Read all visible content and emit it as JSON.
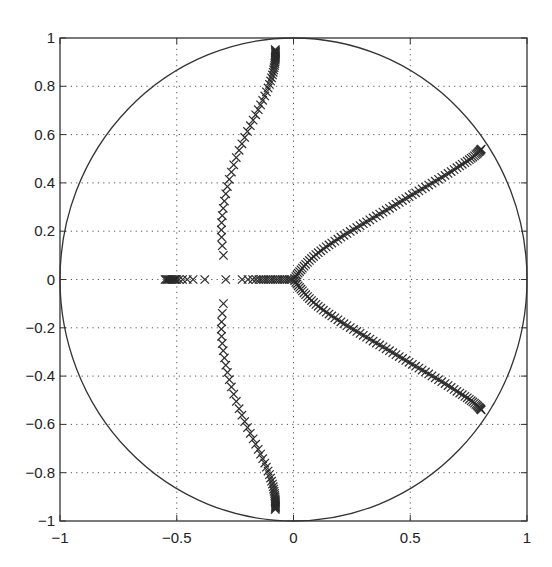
{
  "chart_data": {
    "type": "scatter",
    "title": "",
    "xlabel": "",
    "ylabel": "",
    "xlim": [
      -1,
      1
    ],
    "ylim": [
      -1,
      1
    ],
    "grid": true,
    "xticks": [
      -1,
      -0.5,
      0,
      0.5,
      1
    ],
    "xtick_labels": [
      "−1",
      "−0.5",
      "0",
      "0.5",
      "1"
    ],
    "yticks": [
      -1,
      -0.8,
      -0.6,
      -0.4,
      -0.2,
      0,
      0.2,
      0.4,
      0.6,
      0.8,
      1
    ],
    "ytick_labels": [
      "−1",
      "−0.8",
      "−0.6",
      "−0.4",
      "−0.2",
      "0",
      "0.2",
      "0.4",
      "0.6",
      "0.8",
      "1"
    ],
    "annotations": [
      {
        "type": "unit-circle",
        "center": [
          0,
          0
        ],
        "radius": 1
      }
    ],
    "marker": "x",
    "series": [
      {
        "name": "real-axis-poles",
        "points": [
          [
            -0.55,
            0
          ],
          [
            -0.545,
            0
          ],
          [
            -0.54,
            0
          ],
          [
            -0.535,
            0
          ],
          [
            -0.53,
            0
          ],
          [
            -0.525,
            0
          ],
          [
            -0.52,
            0
          ],
          [
            -0.515,
            0
          ],
          [
            -0.51,
            0
          ],
          [
            -0.505,
            0
          ],
          [
            -0.5,
            0
          ],
          [
            -0.49,
            0
          ],
          [
            -0.475,
            0
          ],
          [
            -0.455,
            0
          ],
          [
            -0.43,
            0
          ],
          [
            -0.38,
            0
          ],
          [
            -0.29,
            0
          ],
          [
            -0.22,
            0
          ],
          [
            -0.195,
            0
          ],
          [
            -0.175,
            0
          ],
          [
            -0.16,
            0
          ],
          [
            -0.148,
            0
          ],
          [
            -0.138,
            0
          ],
          [
            -0.128,
            0
          ],
          [
            -0.118,
            0
          ],
          [
            -0.108,
            0
          ],
          [
            -0.098,
            0
          ],
          [
            -0.088,
            0
          ],
          [
            -0.078,
            0
          ],
          [
            -0.068,
            0
          ],
          [
            -0.058,
            0
          ],
          [
            -0.048,
            0
          ],
          [
            -0.038,
            0
          ],
          [
            -0.028,
            0
          ],
          [
            -0.018,
            0
          ],
          [
            -0.01,
            0
          ]
        ]
      },
      {
        "name": "left-upper-branch",
        "points": [
          [
            -0.3,
            0.1
          ],
          [
            -0.305,
            0.14
          ],
          [
            -0.308,
            0.175
          ],
          [
            -0.309,
            0.205
          ],
          [
            -0.308,
            0.235
          ],
          [
            -0.305,
            0.265
          ],
          [
            -0.301,
            0.295
          ],
          [
            -0.296,
            0.325
          ],
          [
            -0.29,
            0.355
          ],
          [
            -0.283,
            0.385
          ],
          [
            -0.275,
            0.415
          ],
          [
            -0.266,
            0.445
          ],
          [
            -0.256,
            0.475
          ],
          [
            -0.245,
            0.505
          ],
          [
            -0.233,
            0.535
          ],
          [
            -0.221,
            0.562
          ],
          [
            -0.209,
            0.588
          ],
          [
            -0.197,
            0.613
          ],
          [
            -0.185,
            0.637
          ],
          [
            -0.173,
            0.66
          ],
          [
            -0.162,
            0.682
          ],
          [
            -0.151,
            0.703
          ],
          [
            -0.141,
            0.723
          ],
          [
            -0.132,
            0.742
          ],
          [
            -0.123,
            0.76
          ],
          [
            -0.116,
            0.777
          ],
          [
            -0.109,
            0.793
          ],
          [
            -0.103,
            0.808
          ],
          [
            -0.098,
            0.822
          ],
          [
            -0.094,
            0.835
          ],
          [
            -0.09,
            0.847
          ],
          [
            -0.087,
            0.858
          ],
          [
            -0.085,
            0.868
          ],
          [
            -0.083,
            0.877
          ],
          [
            -0.081,
            0.886
          ],
          [
            -0.08,
            0.894
          ],
          [
            -0.079,
            0.901
          ],
          [
            -0.078,
            0.908
          ],
          [
            -0.078,
            0.914
          ],
          [
            -0.077,
            0.92
          ],
          [
            -0.077,
            0.925
          ],
          [
            -0.077,
            0.93
          ],
          [
            -0.077,
            0.935
          ],
          [
            -0.077,
            0.94
          ],
          [
            -0.077,
            0.944
          ],
          [
            -0.078,
            0.948
          ],
          [
            -0.078,
            0.952
          ]
        ]
      },
      {
        "name": "left-lower-branch",
        "points": [
          [
            -0.3,
            -0.1
          ],
          [
            -0.305,
            -0.14
          ],
          [
            -0.308,
            -0.175
          ],
          [
            -0.309,
            -0.205
          ],
          [
            -0.308,
            -0.235
          ],
          [
            -0.305,
            -0.265
          ],
          [
            -0.301,
            -0.295
          ],
          [
            -0.296,
            -0.325
          ],
          [
            -0.29,
            -0.355
          ],
          [
            -0.283,
            -0.385
          ],
          [
            -0.275,
            -0.415
          ],
          [
            -0.266,
            -0.445
          ],
          [
            -0.256,
            -0.475
          ],
          [
            -0.245,
            -0.505
          ],
          [
            -0.233,
            -0.535
          ],
          [
            -0.221,
            -0.562
          ],
          [
            -0.209,
            -0.588
          ],
          [
            -0.197,
            -0.613
          ],
          [
            -0.185,
            -0.637
          ],
          [
            -0.173,
            -0.66
          ],
          [
            -0.162,
            -0.682
          ],
          [
            -0.151,
            -0.703
          ],
          [
            -0.141,
            -0.723
          ],
          [
            -0.132,
            -0.742
          ],
          [
            -0.123,
            -0.76
          ],
          [
            -0.116,
            -0.777
          ],
          [
            -0.109,
            -0.793
          ],
          [
            -0.103,
            -0.808
          ],
          [
            -0.098,
            -0.822
          ],
          [
            -0.094,
            -0.835
          ],
          [
            -0.09,
            -0.847
          ],
          [
            -0.087,
            -0.858
          ],
          [
            -0.085,
            -0.868
          ],
          [
            -0.083,
            -0.877
          ],
          [
            -0.081,
            -0.886
          ],
          [
            -0.08,
            -0.894
          ],
          [
            -0.079,
            -0.901
          ],
          [
            -0.078,
            -0.908
          ],
          [
            -0.078,
            -0.914
          ],
          [
            -0.077,
            -0.92
          ],
          [
            -0.077,
            -0.925
          ],
          [
            -0.077,
            -0.93
          ],
          [
            -0.077,
            -0.935
          ],
          [
            -0.077,
            -0.94
          ],
          [
            -0.077,
            -0.944
          ],
          [
            -0.078,
            -0.948
          ],
          [
            -0.078,
            -0.952
          ]
        ]
      },
      {
        "name": "right-upper-branch",
        "points": [
          [
            0.005,
            0.005
          ],
          [
            0.01,
            0.012
          ],
          [
            0.015,
            0.019
          ],
          [
            0.02,
            0.026
          ],
          [
            0.026,
            0.033
          ],
          [
            0.032,
            0.04
          ],
          [
            0.038,
            0.047
          ],
          [
            0.045,
            0.055
          ],
          [
            0.052,
            0.063
          ],
          [
            0.06,
            0.071
          ],
          [
            0.068,
            0.079
          ],
          [
            0.077,
            0.087
          ],
          [
            0.086,
            0.095
          ],
          [
            0.096,
            0.103
          ],
          [
            0.106,
            0.111
          ],
          [
            0.117,
            0.119
          ],
          [
            0.128,
            0.127
          ],
          [
            0.14,
            0.135
          ],
          [
            0.152,
            0.143
          ],
          [
            0.164,
            0.151
          ],
          [
            0.177,
            0.159
          ],
          [
            0.19,
            0.167
          ],
          [
            0.203,
            0.175
          ],
          [
            0.216,
            0.183
          ],
          [
            0.229,
            0.191
          ],
          [
            0.243,
            0.199
          ],
          [
            0.257,
            0.207
          ],
          [
            0.271,
            0.215
          ],
          [
            0.285,
            0.223
          ],
          [
            0.299,
            0.231
          ],
          [
            0.313,
            0.239
          ],
          [
            0.327,
            0.247
          ],
          [
            0.341,
            0.255
          ],
          [
            0.355,
            0.263
          ],
          [
            0.369,
            0.271
          ],
          [
            0.383,
            0.279
          ],
          [
            0.397,
            0.287
          ],
          [
            0.411,
            0.295
          ],
          [
            0.425,
            0.303
          ],
          [
            0.439,
            0.311
          ],
          [
            0.453,
            0.319
          ],
          [
            0.467,
            0.327
          ],
          [
            0.481,
            0.335
          ],
          [
            0.495,
            0.343
          ],
          [
            0.509,
            0.351
          ],
          [
            0.523,
            0.359
          ],
          [
            0.537,
            0.367
          ],
          [
            0.551,
            0.375
          ],
          [
            0.565,
            0.383
          ],
          [
            0.579,
            0.391
          ],
          [
            0.593,
            0.399
          ],
          [
            0.607,
            0.407
          ],
          [
            0.621,
            0.415
          ],
          [
            0.635,
            0.423
          ],
          [
            0.649,
            0.431
          ],
          [
            0.662,
            0.439
          ],
          [
            0.675,
            0.447
          ],
          [
            0.688,
            0.455
          ],
          [
            0.7,
            0.463
          ],
          [
            0.712,
            0.47
          ],
          [
            0.723,
            0.477
          ],
          [
            0.734,
            0.484
          ],
          [
            0.744,
            0.49
          ],
          [
            0.753,
            0.496
          ],
          [
            0.761,
            0.502
          ],
          [
            0.768,
            0.507
          ],
          [
            0.775,
            0.512
          ],
          [
            0.781,
            0.517
          ],
          [
            0.786,
            0.521
          ],
          [
            0.79,
            0.525
          ],
          [
            0.794,
            0.529
          ],
          [
            0.797,
            0.532
          ],
          [
            0.8,
            0.535
          ],
          [
            0.802,
            0.538
          ],
          [
            0.804,
            0.54
          ]
        ]
      },
      {
        "name": "right-lower-branch",
        "points": [
          [
            0.005,
            -0.005
          ],
          [
            0.01,
            -0.012
          ],
          [
            0.015,
            -0.019
          ],
          [
            0.02,
            -0.026
          ],
          [
            0.026,
            -0.033
          ],
          [
            0.032,
            -0.04
          ],
          [
            0.038,
            -0.047
          ],
          [
            0.045,
            -0.055
          ],
          [
            0.052,
            -0.063
          ],
          [
            0.06,
            -0.071
          ],
          [
            0.068,
            -0.079
          ],
          [
            0.077,
            -0.087
          ],
          [
            0.086,
            -0.095
          ],
          [
            0.096,
            -0.103
          ],
          [
            0.106,
            -0.111
          ],
          [
            0.117,
            -0.119
          ],
          [
            0.128,
            -0.127
          ],
          [
            0.14,
            -0.135
          ],
          [
            0.152,
            -0.143
          ],
          [
            0.164,
            -0.151
          ],
          [
            0.177,
            -0.159
          ],
          [
            0.19,
            -0.167
          ],
          [
            0.203,
            -0.175
          ],
          [
            0.216,
            -0.183
          ],
          [
            0.229,
            -0.191
          ],
          [
            0.243,
            -0.199
          ],
          [
            0.257,
            -0.207
          ],
          [
            0.271,
            -0.215
          ],
          [
            0.285,
            -0.223
          ],
          [
            0.299,
            -0.231
          ],
          [
            0.313,
            -0.239
          ],
          [
            0.327,
            -0.247
          ],
          [
            0.341,
            -0.255
          ],
          [
            0.355,
            -0.263
          ],
          [
            0.369,
            -0.271
          ],
          [
            0.383,
            -0.279
          ],
          [
            0.397,
            -0.287
          ],
          [
            0.411,
            -0.295
          ],
          [
            0.425,
            -0.303
          ],
          [
            0.439,
            -0.311
          ],
          [
            0.453,
            -0.319
          ],
          [
            0.467,
            -0.327
          ],
          [
            0.481,
            -0.335
          ],
          [
            0.495,
            -0.343
          ],
          [
            0.509,
            -0.351
          ],
          [
            0.523,
            -0.359
          ],
          [
            0.537,
            -0.367
          ],
          [
            0.551,
            -0.375
          ],
          [
            0.565,
            -0.383
          ],
          [
            0.579,
            -0.391
          ],
          [
            0.593,
            -0.399
          ],
          [
            0.607,
            -0.407
          ],
          [
            0.621,
            -0.415
          ],
          [
            0.635,
            -0.423
          ],
          [
            0.649,
            -0.431
          ],
          [
            0.662,
            -0.439
          ],
          [
            0.675,
            -0.447
          ],
          [
            0.688,
            -0.455
          ],
          [
            0.7,
            -0.463
          ],
          [
            0.712,
            -0.47
          ],
          [
            0.723,
            -0.477
          ],
          [
            0.734,
            -0.484
          ],
          [
            0.744,
            -0.49
          ],
          [
            0.753,
            -0.496
          ],
          [
            0.761,
            -0.502
          ],
          [
            0.768,
            -0.507
          ],
          [
            0.775,
            -0.512
          ],
          [
            0.781,
            -0.517
          ],
          [
            0.786,
            -0.521
          ],
          [
            0.79,
            -0.525
          ],
          [
            0.794,
            -0.529
          ],
          [
            0.797,
            -0.532
          ],
          [
            0.8,
            -0.535
          ],
          [
            0.802,
            -0.538
          ],
          [
            0.804,
            -0.54
          ]
        ]
      }
    ]
  }
}
